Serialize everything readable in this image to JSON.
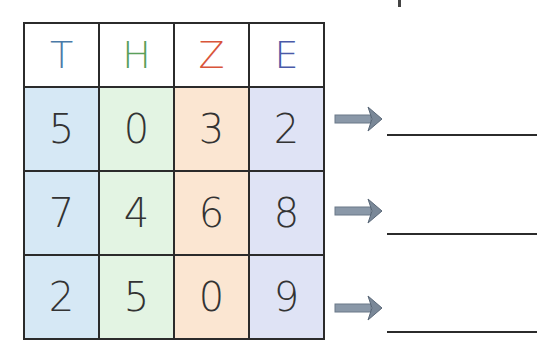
{
  "table": {
    "headers": [
      {
        "label": "T",
        "color": "#4a7aa8"
      },
      {
        "label": "H",
        "color": "#5aa05a"
      },
      {
        "label": "Z",
        "color": "#d9553a"
      },
      {
        "label": "E",
        "color": "#4a5aa8"
      }
    ],
    "column_backgrounds": [
      "#d6e8f5",
      "#e3f4e3",
      "#fbe6d2",
      "#dfe3f5"
    ],
    "rows": [
      [
        "5",
        "0",
        "3",
        "2"
      ],
      [
        "7",
        "4",
        "6",
        "8"
      ],
      [
        "2",
        "5",
        "0",
        "9"
      ]
    ]
  },
  "answers": [
    {
      "icon": "arrow-right-icon",
      "value": ""
    },
    {
      "icon": "arrow-right-icon",
      "value": ""
    },
    {
      "icon": "arrow-right-icon",
      "value": ""
    }
  ]
}
